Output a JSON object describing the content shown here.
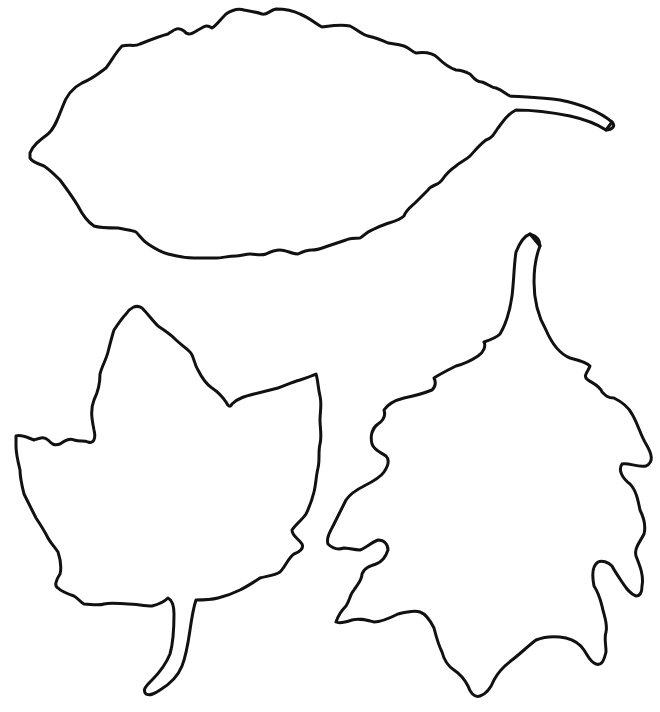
{
  "page": {
    "background": "#ffffff"
  },
  "style": {
    "stroke_color": "#111111",
    "stroke_width": 3
  },
  "leaves": [
    {
      "name": "elongated-serrated-leaf",
      "description": "Oval serrated leaf with stem pointing right"
    },
    {
      "name": "lobed-maple-like-leaf",
      "description": "Three-lobed leaf with stem pointing down"
    },
    {
      "name": "oak-like-leaf",
      "description": "Deeply lobed leaf with stem pointing up"
    }
  ]
}
